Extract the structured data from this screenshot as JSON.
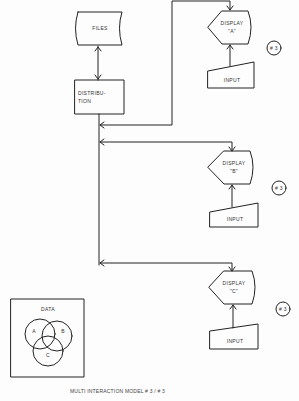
{
  "diagram": {
    "caption": "MULTI INTERACTION MODEL  # 3 / # 3",
    "nodes": {
      "files": {
        "label": "FILES",
        "shape": "stored-data"
      },
      "distribution": {
        "line1": "DISTRIBU-",
        "line2": "TION",
        "shape": "process"
      },
      "display_a": {
        "line1": "DISPLAY",
        "line2": "\"A\"",
        "shape": "display"
      },
      "display_b": {
        "line1": "DISPLAY",
        "line2": "\"B\"",
        "shape": "display"
      },
      "display_c": {
        "line1": "DISPLAY",
        "line2": "\"C\"",
        "shape": "display"
      },
      "input_a": {
        "label": "INPUT",
        "shape": "manual-input"
      },
      "input_b": {
        "label": "INPUT",
        "shape": "manual-input"
      },
      "input_c": {
        "label": "INPUT",
        "shape": "manual-input"
      },
      "badge_a": {
        "label": "# 3"
      },
      "badge_b": {
        "label": "# 3"
      },
      "badge_c": {
        "label": "# 3"
      }
    },
    "legend": {
      "title": "DATA",
      "sets": [
        "A",
        "B",
        "C"
      ]
    },
    "edges": [
      {
        "from": "files",
        "to": "distribution",
        "type": "bidirectional"
      },
      {
        "from": "distribution",
        "to": "display_a",
        "type": "bidirectional"
      },
      {
        "from": "distribution",
        "to": "display_b",
        "type": "bidirectional"
      },
      {
        "from": "distribution",
        "to": "display_c",
        "type": "bidirectional"
      },
      {
        "from": "input_a",
        "to": "display_a",
        "type": "directed"
      },
      {
        "from": "input_b",
        "to": "display_b",
        "type": "directed"
      },
      {
        "from": "input_c",
        "to": "display_c",
        "type": "directed"
      }
    ]
  }
}
